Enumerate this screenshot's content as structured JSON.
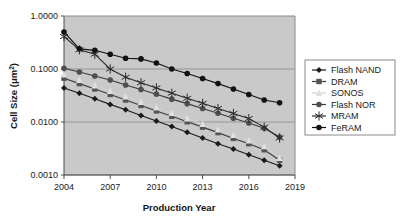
{
  "chart_data": {
    "type": "line",
    "title": "",
    "xlabel": "Production Year",
    "ylabel": "Cell Size (μm²)",
    "ylabel_base": "Cell Size (μm",
    "ylabel_sup": "2",
    "ylabel_tail": ")",
    "yscale": "log",
    "ylim": [
      0.001,
      1.0
    ],
    "xlim": [
      2004,
      2019
    ],
    "grid": true,
    "grid_axis": "y",
    "legend_position": "right",
    "plot_background": "#c9c9c9",
    "plot_border": "#808080",
    "gridline_color": "#8c8c8c",
    "x_ticks": [
      "2004",
      "2007",
      "2010",
      "2013",
      "2016",
      "2019"
    ],
    "x_tick_values": [
      2004,
      2007,
      2010,
      2013,
      2016,
      2019
    ],
    "y_ticks": [
      "1.0000",
      "0.1000",
      "0.0100",
      "0.0010"
    ],
    "y_tick_values": [
      1.0,
      0.1,
      0.01,
      0.001
    ],
    "x": [
      2004,
      2005,
      2006,
      2007,
      2008,
      2009,
      2010,
      2011,
      2012,
      2013,
      2014,
      2015,
      2016,
      2017,
      2018
    ],
    "series": [
      {
        "name": "Flash NAND",
        "marker": "diamond",
        "color": "#1a1a1a",
        "line_color": "#1a1a1a",
        "values": [
          0.044,
          0.035,
          0.0275,
          0.0215,
          0.017,
          0.0132,
          0.0104,
          0.0082,
          0.0064,
          0.005,
          0.0039,
          0.0031,
          0.0024,
          0.0019,
          0.0015
        ]
      },
      {
        "name": "DRAM",
        "marker": "square",
        "color": "#545454",
        "line_color": "#3d3d3d",
        "values": [
          0.067,
          0.053,
          0.042,
          0.033,
          0.026,
          0.0205,
          0.0162,
          0.0128,
          0.0101,
          0.008,
          0.0063,
          0.0049,
          0.0039,
          0.003,
          0.0019
        ]
      },
      {
        "name": "SONOS",
        "marker": "triangle",
        "color": "#e0e0e0",
        "line_color": "#cfcfcf",
        "values": [
          0.079,
          0.062,
          0.049,
          0.0385,
          0.0303,
          0.0239,
          0.0188,
          0.0148,
          0.0117,
          0.0092,
          0.0072,
          0.0057,
          0.0045,
          0.0035,
          0.0021
        ]
      },
      {
        "name": "Flash NOR",
        "marker": "circle",
        "color": "#4f4f4f",
        "line_color": "#3a3a3a",
        "values": [
          0.103,
          0.088,
          0.074,
          0.062,
          0.05,
          0.041,
          0.0335,
          0.027,
          0.0222,
          0.018,
          0.0146,
          0.0118,
          0.0096,
          0.0076,
          0.0052
        ]
      },
      {
        "name": "MRAM",
        "marker": "asterisk",
        "color": "#2b2b2b",
        "line_color": "#2b2b2b",
        "values": [
          0.41,
          0.23,
          0.19,
          0.1,
          0.07,
          0.055,
          0.044,
          0.035,
          0.028,
          0.0225,
          0.018,
          0.0145,
          0.0116,
          0.008,
          0.005
        ]
      },
      {
        "name": "FeRAM",
        "marker": "circle-filled",
        "color": "#111111",
        "line_color": "#111111",
        "values": [
          0.5,
          0.24,
          0.225,
          0.19,
          0.16,
          0.155,
          0.13,
          0.1,
          0.082,
          0.066,
          0.053,
          0.042,
          0.033,
          0.026,
          0.023
        ]
      }
    ]
  },
  "legend": {
    "items": [
      {
        "label": "Flash NAND"
      },
      {
        "label": "DRAM"
      },
      {
        "label": "SONOS"
      },
      {
        "label": "Flash NOR"
      },
      {
        "label": "MRAM"
      },
      {
        "label": "FeRAM"
      }
    ]
  }
}
